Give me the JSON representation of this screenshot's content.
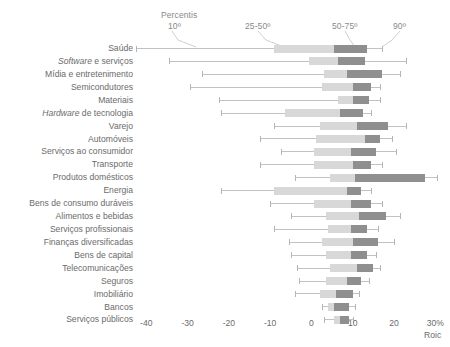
{
  "annotations": {
    "percentis_label": "Percentis",
    "p10": "10º",
    "p25_50": "25-50º",
    "p50_75": "50-75º",
    "p90": "90º"
  },
  "axis": {
    "unit_label": "30%",
    "axis_name": "Roic",
    "ticks": [
      "-40",
      "-30",
      "-20",
      "-10",
      "0",
      "10",
      "20",
      "30%"
    ],
    "tick_values": [
      -40,
      -30,
      -20,
      -10,
      0,
      10,
      20,
      30
    ],
    "min": -44,
    "max": 33
  },
  "chart_data": {
    "type": "bar",
    "subtype": "box-whisker-horizontal",
    "title": "",
    "xlabel": "Roic",
    "ylabel": "",
    "xlim": [
      -44,
      33
    ],
    "grid": false,
    "legend": [
      "10º",
      "25-50º",
      "50-75º",
      "90º"
    ],
    "legend_position": "top",
    "categories": [
      "Saúde",
      "Software e serviços",
      "Mídia e entretenimento",
      "Semicondutores",
      "Materiais",
      "Hardware de tecnologia",
      "Varejo",
      "Automóveis",
      "Serviços ao consumidor",
      "Transporte",
      "Produtos domésticos",
      "Energia",
      "Bens de consumo duráveis",
      "Alimentos e bebidas",
      "Serviços profissionais",
      "Finanças diversificadas",
      "Bens de capital",
      "Telecomunicações",
      "Seguros",
      "Imobiliário",
      "Bancos",
      "Serviços públicos"
    ],
    "category_styles": [
      "normal",
      "italic-first",
      "normal",
      "normal",
      "normal",
      "italic-first",
      "normal",
      "normal",
      "normal",
      "normal",
      "normal",
      "normal",
      "normal",
      "normal",
      "normal",
      "normal",
      "normal",
      "normal",
      "normal",
      "normal",
      "normal",
      "normal"
    ],
    "series": [
      {
        "name": "p10"
      },
      {
        "name": "p25"
      },
      {
        "name": "p50"
      },
      {
        "name": "p75"
      },
      {
        "name": "p90"
      }
    ],
    "boxes": [
      {
        "category": "Saúde",
        "p10": -42.5,
        "p25": -9.0,
        "p50": 5.5,
        "p75": 13.5,
        "p90": 17.0
      },
      {
        "category": "Software e serviços",
        "p10": -34.5,
        "p25": -0.5,
        "p50": 6.5,
        "p75": 13.0,
        "p90": 23.0
      },
      {
        "category": "Mídia e entretenimento",
        "p10": -26.5,
        "p25": 3.0,
        "p50": 8.5,
        "p75": 17.0,
        "p90": 21.5
      },
      {
        "category": "Semicondutores",
        "p10": -29.5,
        "p25": 2.5,
        "p50": 10.0,
        "p75": 14.5,
        "p90": 16.5
      },
      {
        "category": "Materiais",
        "p10": -22.5,
        "p25": 6.5,
        "p50": 10.0,
        "p75": 14.0,
        "p90": 16.5
      },
      {
        "category": "Hardware de tecnologia",
        "p10": -22.0,
        "p25": -6.5,
        "p50": 7.0,
        "p75": 12.5,
        "p90": 14.5
      },
      {
        "category": "Varejo",
        "p10": -9.0,
        "p25": 2.0,
        "p50": 11.0,
        "p75": 18.5,
        "p90": 23.0
      },
      {
        "category": "Automóveis",
        "p10": -12.5,
        "p25": 1.0,
        "p50": 13.0,
        "p75": 16.5,
        "p90": 19.5
      },
      {
        "category": "Serviços ao consumidor",
        "p10": -7.5,
        "p25": 0.5,
        "p50": 9.5,
        "p75": 15.5,
        "p90": 20.5
      },
      {
        "category": "Transporte",
        "p10": -12.5,
        "p25": 0.5,
        "p50": 10.0,
        "p75": 14.5,
        "p90": 17.0
      },
      {
        "category": "Produtos domésticos",
        "p10": -4.0,
        "p25": 4.5,
        "p50": 10.5,
        "p75": 27.5,
        "p90": 30.5
      },
      {
        "category": "Energia",
        "p10": -22.0,
        "p25": -9.0,
        "p50": 8.5,
        "p75": 12.0,
        "p90": 14.5
      },
      {
        "category": "Bens de consumo duráveis",
        "p10": -10.0,
        "p25": 0.5,
        "p50": 9.5,
        "p75": 14.5,
        "p90": 17.0
      },
      {
        "category": "Alimentos e bebidas",
        "p10": -5.0,
        "p25": 3.5,
        "p50": 11.5,
        "p75": 18.0,
        "p90": 21.5
      },
      {
        "category": "Serviços profissionais",
        "p10": -9.0,
        "p25": 4.0,
        "p50": 9.5,
        "p75": 13.5,
        "p90": 16.0
      },
      {
        "category": "Finanças diversificadas",
        "p10": -5.5,
        "p25": 2.5,
        "p50": 10.0,
        "p75": 16.0,
        "p90": 20.0
      },
      {
        "category": "Bens de capital",
        "p10": -5.0,
        "p25": 3.5,
        "p50": 9.5,
        "p75": 13.5,
        "p90": 15.5
      },
      {
        "category": "Telecomunicações",
        "p10": -3.5,
        "p25": 4.5,
        "p50": 11.0,
        "p75": 15.0,
        "p90": 16.5
      },
      {
        "category": "Seguros",
        "p10": -3.0,
        "p25": 3.5,
        "p50": 8.5,
        "p75": 12.0,
        "p90": 14.0
      },
      {
        "category": "Imobiliário",
        "p10": -4.0,
        "p25": 2.0,
        "p50": 6.0,
        "p75": 10.0,
        "p90": 11.5
      },
      {
        "category": "Bancos",
        "p10": 2.5,
        "p25": 4.0,
        "p50": 5.5,
        "p75": 9.0,
        "p90": 10.5
      },
      {
        "category": "Serviços públicos",
        "p10": 3.0,
        "p25": 5.5,
        "p50": 7.0,
        "p75": 9.0,
        "p90": 10.0
      }
    ]
  }
}
